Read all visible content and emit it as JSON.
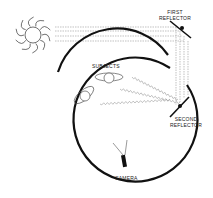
{
  "diagram": {
    "labels": {
      "first_reflector_line1": "FIRST",
      "first_reflector_line2": "REFLECTOR",
      "subjects": "SUBJECTS",
      "second_reflector_line1": "SECOND",
      "second_reflector_line2": "REFLECTOR",
      "camera": "CAMERA"
    },
    "elements": [
      "sun-icon",
      "first-reflector",
      "second-reflector",
      "subjects",
      "camera",
      "enclosure-circle",
      "light-rays"
    ],
    "colors": {
      "stroke": "#111111",
      "ray": "#888888"
    }
  }
}
